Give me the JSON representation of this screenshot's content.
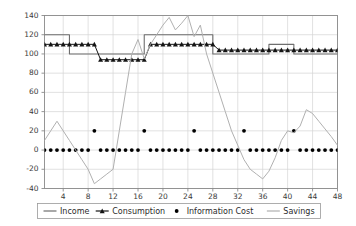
{
  "chart_data": {
    "type": "line",
    "title": "",
    "xlabel": "",
    "ylabel": "",
    "xlim": [
      1,
      48
    ],
    "ylim": [
      -40,
      140
    ],
    "grid": true,
    "legend_position": "bottom",
    "yticks": [
      -40,
      -20,
      0,
      20,
      40,
      60,
      80,
      100,
      120,
      140
    ],
    "ytick_labels": [
      "-40",
      "-20",
      "0",
      "20",
      "40",
      "60",
      "80",
      "100",
      "120",
      "140"
    ],
    "xticks": [
      4,
      8,
      12,
      16,
      20,
      24,
      28,
      32,
      36,
      40,
      44,
      48
    ],
    "xtick_labels": [
      "4",
      "8",
      "12",
      "16",
      "20",
      "24",
      "28",
      "32",
      "36",
      "40",
      "44",
      "48"
    ],
    "x": [
      1,
      2,
      3,
      4,
      5,
      6,
      7,
      8,
      9,
      10,
      11,
      12,
      13,
      14,
      15,
      16,
      17,
      18,
      19,
      20,
      21,
      22,
      23,
      24,
      25,
      26,
      27,
      28,
      29,
      30,
      31,
      32,
      33,
      34,
      35,
      36,
      37,
      38,
      39,
      40,
      41,
      42,
      43,
      44,
      45,
      46,
      47,
      48
    ],
    "series": [
      {
        "name": "Income",
        "color": "#6e6e6e",
        "style": "step-line",
        "marker": "none",
        "values": [
          120,
          120,
          120,
          120,
          100,
          100,
          100,
          100,
          100,
          100,
          100,
          100,
          100,
          100,
          100,
          100,
          120,
          120,
          120,
          120,
          120,
          120,
          120,
          120,
          120,
          120,
          120,
          100,
          100,
          100,
          100,
          100,
          100,
          100,
          100,
          100,
          110,
          110,
          110,
          110,
          100,
          100,
          100,
          100,
          100,
          100,
          100,
          100
        ]
      },
      {
        "name": "Consumption",
        "color": "#141414",
        "style": "line",
        "marker": "triangle",
        "values": [
          110,
          110,
          110,
          110,
          110,
          110,
          110,
          110,
          110,
          94,
          94,
          94,
          94,
          94,
          94,
          94,
          94,
          110,
          110,
          110,
          110,
          110,
          110,
          110,
          110,
          110,
          110,
          110,
          104,
          104,
          104,
          104,
          104,
          104,
          104,
          104,
          104,
          104,
          104,
          104,
          104,
          104,
          104,
          104,
          104,
          104,
          104,
          104
        ]
      },
      {
        "name": "Information Cost",
        "color": "#000000",
        "style": "markers",
        "marker": "dot",
        "values": [
          0,
          0,
          0,
          0,
          0,
          0,
          0,
          0,
          20,
          0,
          0,
          0,
          0,
          0,
          0,
          0,
          20,
          0,
          0,
          0,
          0,
          0,
          0,
          0,
          20,
          0,
          0,
          0,
          0,
          0,
          0,
          0,
          20,
          0,
          0,
          0,
          0,
          0,
          0,
          0,
          20,
          0,
          0,
          0,
          0,
          0,
          0,
          0
        ]
      },
      {
        "name": "Savings",
        "color": "#b0b0b0",
        "style": "line",
        "marker": "none",
        "values": [
          10,
          20,
          30,
          20,
          10,
          0,
          -10,
          -20,
          -35,
          -30,
          -25,
          -20,
          20,
          60,
          100,
          115,
          95,
          110,
          120,
          130,
          138,
          125,
          132,
          140,
          118,
          130,
          100,
          80,
          60,
          40,
          20,
          5,
          -10,
          -20,
          -25,
          -30,
          -22,
          -8,
          10,
          20,
          18,
          25,
          42,
          38,
          30,
          22,
          14,
          5
        ]
      }
    ]
  },
  "legend": {
    "items": [
      {
        "label": "Income",
        "icon": "line-swatch",
        "color": "#6e6e6e"
      },
      {
        "label": "Consumption",
        "icon": "line-triangle-swatch",
        "color": "#141414"
      },
      {
        "label": "Information Cost",
        "icon": "dot-swatch",
        "color": "#000000"
      },
      {
        "label": "Savings",
        "icon": "line-swatch",
        "color": "#b0b0b0"
      }
    ]
  },
  "axes": {
    "frame_color": "#8a8a8a",
    "grid_color": "#d4d4d4",
    "background": "#ffffff"
  }
}
